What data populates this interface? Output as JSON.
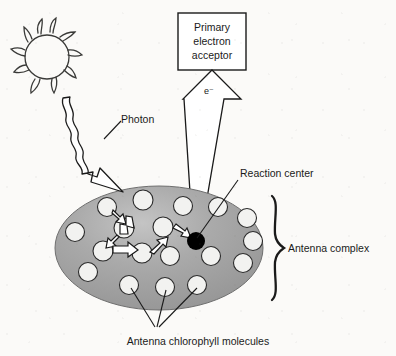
{
  "figure": {
    "background_color": "#fbfaf8",
    "ink_color": "#1a1a1a"
  },
  "labels": {
    "acceptor_line1": "Primary",
    "acceptor_line2": "electron",
    "acceptor_line3": "acceptor",
    "electron": "e⁻",
    "photon": "Photon",
    "reaction_center": "Reaction center",
    "antenna_complex": "Antenna complex",
    "antenna_chlorophyll": "Antenna chlorophyll molecules"
  },
  "colors": {
    "antenna_fill": "#9c9c9c",
    "antenna_highlight": "#bfbfbf",
    "chlorophyll_fill": "#f2f2f0",
    "reaction_center_fill": "#000000",
    "arrow_fill": "#ffffff",
    "stroke": "#1a1a1a"
  },
  "elements": {
    "sun": {
      "name": "sun",
      "cx": 47,
      "cy": 57,
      "r": 22,
      "ray_count": 8
    },
    "acceptor_box": {
      "name": "primary-electron-acceptor-box",
      "x": 178,
      "y": 13,
      "width": 68,
      "height": 57
    },
    "electron_arrow": {
      "name": "electron-transfer-arrow",
      "tip_x": 196,
      "tip_y": 238,
      "head_y": 71,
      "direction": "up"
    },
    "photon_arrow": {
      "name": "photon-wavy-arrow",
      "start_x": 63,
      "start_y": 98,
      "end_x": 123,
      "end_y": 192,
      "direction": "down-right"
    },
    "antenna_ellipse": {
      "name": "antenna-complex-ellipse",
      "cx": 159,
      "cy": 248,
      "rx": 104,
      "ry": 62
    },
    "reaction_center_dot": {
      "name": "reaction-center-dot",
      "cx": 196,
      "cy": 241,
      "r": 9
    },
    "antenna_brace": {
      "name": "antenna-complex-brace",
      "x": 277,
      "top_y": 196,
      "bottom_y": 300
    }
  },
  "chlorophyll_molecules": [
    {
      "cx": 107,
      "cy": 207,
      "r": 9.5
    },
    {
      "cx": 143,
      "cy": 200,
      "r": 10
    },
    {
      "cx": 183,
      "cy": 206,
      "r": 9.5
    },
    {
      "cx": 218,
      "cy": 207,
      "r": 9.5
    },
    {
      "cx": 247,
      "cy": 218,
      "r": 9.5
    },
    {
      "cx": 75,
      "cy": 232,
      "r": 9.5
    },
    {
      "cx": 124,
      "cy": 228,
      "r": 10
    },
    {
      "cx": 163,
      "cy": 227,
      "r": 10
    },
    {
      "cx": 253,
      "cy": 241,
      "r": 9.5
    },
    {
      "cx": 103,
      "cy": 251,
      "r": 10
    },
    {
      "cx": 142,
      "cy": 253,
      "r": 10
    },
    {
      "cx": 170,
      "cy": 256,
      "r": 9.5
    },
    {
      "cx": 211,
      "cy": 256,
      "r": 9.5
    },
    {
      "cx": 243,
      "cy": 263,
      "r": 9.5
    },
    {
      "cx": 88,
      "cy": 272,
      "r": 9.5
    },
    {
      "cx": 129,
      "cy": 285,
      "r": 9.5
    },
    {
      "cx": 165,
      "cy": 287,
      "r": 9.5
    },
    {
      "cx": 197,
      "cy": 285,
      "r": 9.5
    }
  ],
  "energy_transfer_arrows": [
    {
      "from": "107,207",
      "to": "131,222",
      "label": "arrow-1"
    },
    {
      "from": "139,216",
      "to": "124,238",
      "label": "arrow-2"
    },
    {
      "from": "118,241",
      "to": "111,252",
      "label": "arrow-3"
    },
    {
      "from": "114,252",
      "to": "141,252",
      "label": "arrow-4"
    },
    {
      "from": "150,250",
      "to": "169,236",
      "label": "arrow-5"
    },
    {
      "from": "177,228",
      "to": "192,239",
      "label": "arrow-6"
    }
  ],
  "leader_lines": {
    "photon": {
      "x1": 104,
      "y1": 139,
      "x2": 120,
      "y2": 121
    },
    "reaction_center": {
      "x1": 197,
      "y1": 238,
      "x2": 238,
      "y2": 180
    },
    "chlorophyll": [
      {
        "x1": 155,
        "y1": 327,
        "x2": 131,
        "y2": 288
      },
      {
        "x1": 157,
        "y1": 327,
        "x2": 166,
        "y2": 290
      },
      {
        "x1": 159,
        "y1": 327,
        "x2": 197,
        "y2": 288
      }
    ]
  },
  "text_positions": {
    "photon": {
      "x": 121,
      "y": 123
    },
    "reaction_center": {
      "x": 240,
      "y": 177
    },
    "antenna_complex": {
      "x": 288,
      "y": 252
    },
    "antenna_chlorophyll": {
      "x": 198,
      "y": 344
    },
    "electron": {
      "x": 208,
      "y": 93
    },
    "acceptor": {
      "x": 212,
      "y": 30
    }
  }
}
